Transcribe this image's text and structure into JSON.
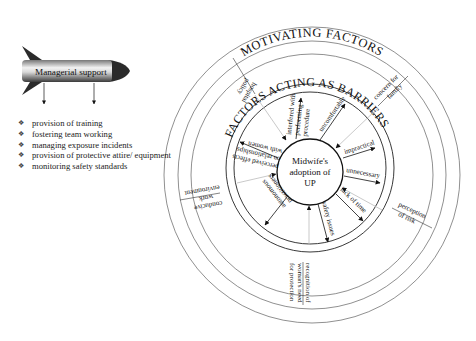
{
  "rocket": {
    "label": "Managerial support"
  },
  "support_items": [
    "provision of training",
    "fostering team working",
    "managing exposure incidents",
    "provision of protective attire/ equipment",
    "monitoring safety standards"
  ],
  "outer_ring": {
    "title": "MOTIVATING FACTORS",
    "labels": {
      "hospital_policy": [
        "hospital",
        "policy"
      ],
      "concern_for_family": [
        "concern for",
        "family"
      ],
      "perception_of_risk": [
        "perception",
        "of risk"
      ],
      "recognition": [
        "recognition of",
        "woman's need",
        "for protection"
      ],
      "conducive_work_environment": [
        "conducive",
        "work",
        "environment"
      ]
    }
  },
  "inner_ring": {
    "title": "FACTORS ACTING AS BARRIERS",
    "labels": {
      "interfered": [
        "interfered with",
        "performing",
        "procedure"
      ],
      "uncomfortable": [
        "uncomfortable"
      ],
      "impractical": [
        "impractical"
      ],
      "unnecessary": [
        "unnecessary"
      ],
      "lack_of_time": [
        "lack of time"
      ],
      "safety_issues": [
        "safety issues"
      ],
      "autonomous": [
        "autonomous",
        "practitioners"
      ],
      "perceived_effects": [
        "perceived effects",
        "on relationships",
        "with women"
      ]
    }
  },
  "center": {
    "lines": [
      "Midwife's",
      "adoption of",
      "UP"
    ]
  },
  "colors": {
    "line": "#333333",
    "faint_arrow": "#bdbdbd",
    "rocket_dark": "#2b2b2b"
  }
}
